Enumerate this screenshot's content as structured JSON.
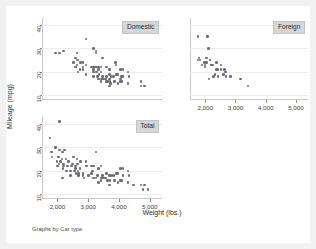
{
  "figure": {
    "note": "Graphs by Car type",
    "xlabel": "Weight (lbs.)",
    "ylabel": "Mileage (mpg)"
  },
  "chart_data": {
    "type": "scatter",
    "title": "",
    "xlabel": "Weight (lbs.)",
    "ylabel": "Mileage (mpg)",
    "xlim": [
      1500,
      5400
    ],
    "ylim": [
      8,
      43
    ],
    "xticks": [
      2000,
      3000,
      4000,
      5000
    ],
    "xtick_labels": [
      "2,000",
      "3,000",
      "4,000",
      "5,000"
    ],
    "yticks": [
      10,
      20,
      30,
      40
    ],
    "ytick_labels": [
      "10",
      "20",
      "30",
      "40"
    ],
    "grid": "horizontal",
    "legend": "none",
    "marker_color": "#6b6b75",
    "panel_label_bg": "#d6d6d6",
    "panels": [
      {
        "name": "domestic",
        "label": "Domestic",
        "position": "top-left",
        "points": [
          [
            2930,
            34
          ],
          [
            2640,
            28
          ],
          [
            3180,
            30
          ],
          [
            3250,
            29
          ],
          [
            3470,
            26
          ],
          [
            3210,
            22
          ],
          [
            3600,
            22
          ],
          [
            2750,
            24
          ],
          [
            3280,
            22
          ],
          [
            3880,
            24
          ],
          [
            3420,
            22
          ],
          [
            3900,
            23
          ],
          [
            4060,
            21
          ],
          [
            3330,
            22
          ],
          [
            2830,
            24
          ],
          [
            3700,
            19
          ],
          [
            3470,
            18
          ],
          [
            3600,
            18
          ],
          [
            3740,
            18
          ],
          [
            4130,
            18
          ],
          [
            4330,
            18
          ],
          [
            4290,
            20
          ],
          [
            4720,
            14
          ],
          [
            4840,
            14
          ],
          [
            4720,
            16
          ],
          [
            4130,
            21
          ],
          [
            3700,
            21
          ],
          [
            3955,
            19
          ],
          [
            3830,
            18
          ],
          [
            4080,
            18
          ],
          [
            3900,
            19
          ],
          [
            3690,
            17
          ],
          [
            3420,
            20
          ],
          [
            3180,
            22
          ],
          [
            3100,
            22
          ],
          [
            2830,
            21
          ],
          [
            2660,
            25
          ],
          [
            2580,
            26
          ],
          [
            2520,
            24
          ],
          [
            2610,
            22
          ],
          [
            2640,
            23
          ],
          [
            3250,
            28
          ],
          [
            3690,
            14
          ],
          [
            3970,
            15
          ],
          [
            4290,
            15
          ],
          [
            4030,
            16
          ],
          [
            3710,
            16
          ],
          [
            3440,
            17
          ],
          [
            3350,
            19
          ],
          [
            3340,
            21
          ],
          [
            3280,
            20
          ],
          [
            2730,
            21
          ],
          [
            2830,
            22
          ],
          [
            3170,
            20
          ],
          [
            3600,
            16
          ],
          [
            3620,
            16
          ],
          [
            3730,
            15
          ],
          [
            4080,
            16
          ],
          [
            3420,
            16
          ],
          [
            3180,
            18
          ],
          [
            2930,
            19
          ],
          [
            2670,
            20
          ],
          [
            2580,
            22
          ],
          [
            3310,
            18
          ],
          [
            3490,
            17
          ],
          [
            3570,
            17
          ],
          [
            3860,
            16
          ],
          [
            4060,
            17
          ],
          [
            3180,
            21
          ],
          [
            2930,
            23
          ],
          [
            2200,
            29
          ],
          [
            2070,
            28
          ],
          [
            1930,
            28
          ],
          [
            3330,
            17
          ]
        ]
      },
      {
        "name": "foreign",
        "label": "Foreign",
        "position": "top-right",
        "points": [
          [
            2070,
            35
          ],
          [
            2120,
            30
          ],
          [
            1760,
            25
          ],
          [
            2040,
            26
          ],
          [
            2190,
            23
          ],
          [
            2520,
            21
          ],
          [
            1830,
            25
          ],
          [
            2160,
            25
          ],
          [
            2670,
            20
          ],
          [
            1990,
            23
          ],
          [
            2240,
            23
          ],
          [
            2370,
            24
          ],
          [
            2650,
            21
          ],
          [
            2280,
            18
          ],
          [
            2430,
            18
          ],
          [
            2130,
            17
          ],
          [
            1800,
            26
          ],
          [
            1760,
            35
          ],
          [
            2050,
            24
          ],
          [
            2410,
            21
          ],
          [
            2200,
            23
          ],
          [
            2690,
            18
          ],
          [
            2830,
            18
          ],
          [
            3170,
            17
          ],
          [
            3420,
            14
          ],
          [
            2520,
            23
          ],
          [
            2160,
            25
          ],
          [
            1980,
            24
          ],
          [
            2370,
            21
          ],
          [
            2610,
            19
          ],
          [
            2330,
            19
          ],
          [
            2000,
            22
          ],
          [
            1890,
            23
          ]
        ]
      },
      {
        "name": "total",
        "label": "Total",
        "position": "bottom-left",
        "points": [
          [
            2070,
            41
          ],
          [
            1760,
            34
          ],
          [
            1930,
            30
          ],
          [
            2070,
            29
          ],
          [
            2240,
            29
          ],
          [
            2160,
            28
          ],
          [
            1800,
            28
          ],
          [
            2020,
            26
          ],
          [
            2150,
            25
          ],
          [
            2280,
            25
          ],
          [
            1830,
            26
          ],
          [
            1990,
            24
          ],
          [
            2110,
            24
          ],
          [
            2370,
            24
          ],
          [
            2500,
            23
          ],
          [
            2650,
            23
          ],
          [
            2200,
            22
          ],
          [
            2330,
            22
          ],
          [
            2450,
            22
          ],
          [
            2590,
            21
          ],
          [
            2730,
            21
          ],
          [
            2180,
            21
          ],
          [
            2300,
            20
          ],
          [
            2430,
            20
          ],
          [
            2560,
            20
          ],
          [
            2690,
            19
          ],
          [
            2830,
            19
          ],
          [
            2950,
            22
          ],
          [
            3100,
            22
          ],
          [
            3250,
            28
          ],
          [
            3180,
            22
          ],
          [
            3330,
            21
          ],
          [
            3420,
            22
          ],
          [
            2930,
            24
          ],
          [
            2750,
            24
          ],
          [
            2640,
            25
          ],
          [
            2520,
            26
          ],
          [
            3600,
            19
          ],
          [
            3690,
            18
          ],
          [
            3740,
            18
          ],
          [
            3830,
            18
          ],
          [
            3900,
            19
          ],
          [
            3955,
            19
          ],
          [
            4060,
            21
          ],
          [
            4130,
            21
          ],
          [
            4290,
            20
          ],
          [
            4330,
            18
          ],
          [
            3470,
            18
          ],
          [
            3490,
            17
          ],
          [
            3570,
            17
          ],
          [
            3620,
            16
          ],
          [
            3710,
            16
          ],
          [
            3860,
            16
          ],
          [
            4080,
            16
          ],
          [
            3970,
            15
          ],
          [
            4030,
            16
          ],
          [
            4290,
            15
          ],
          [
            4720,
            14
          ],
          [
            4840,
            14
          ],
          [
            3690,
            14
          ],
          [
            3340,
            15
          ],
          [
            3180,
            17
          ],
          [
            3250,
            17
          ],
          [
            3420,
            16
          ],
          [
            2830,
            18
          ],
          [
            2670,
            20
          ],
          [
            2580,
            22
          ],
          [
            3100,
            19
          ],
          [
            2610,
            19
          ],
          [
            2430,
            18
          ],
          [
            2160,
            17
          ],
          [
            2000,
            22
          ],
          [
            2050,
            23
          ],
          [
            2690,
            18
          ],
          [
            2870,
            17
          ],
          [
            3010,
            18
          ],
          [
            3150,
            20
          ],
          [
            4130,
            18
          ],
          [
            4470,
            14
          ],
          [
            4780,
            12
          ],
          [
            4950,
            12
          ],
          [
            3310,
            18
          ],
          [
            3440,
            17
          ],
          [
            2040,
            26
          ],
          [
            2190,
            23
          ]
        ]
      }
    ]
  }
}
